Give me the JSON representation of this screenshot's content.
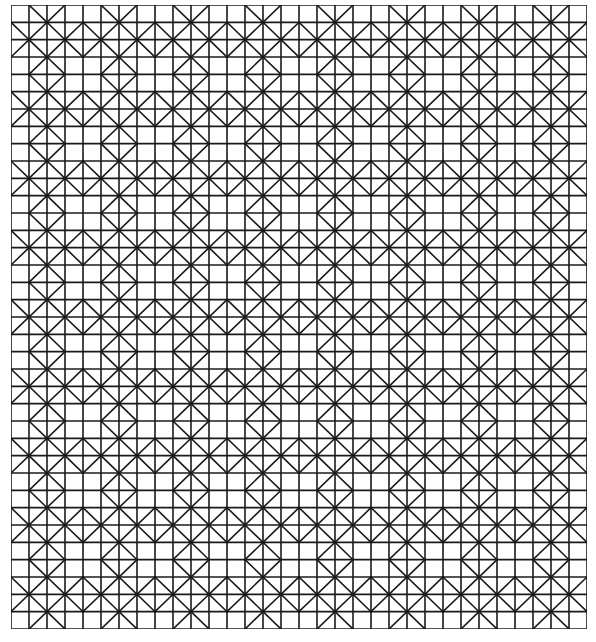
{
  "figure": {
    "type": "geometric-line-pattern",
    "grid": {
      "columns": 32,
      "rows": 36
    },
    "bounds": {
      "x": 11,
      "y": 5,
      "width": 576,
      "height": 624
    },
    "line_color": "#1a1a1a",
    "background_color": "#ffffff",
    "diagonal_pattern_period": {
      "columns": 4,
      "rows": 4
    },
    "diagonal_pattern": [
      [
        "",
        "\\",
        "/",
        ""
      ],
      [
        "\\",
        "/",
        "\\",
        "/"
      ],
      [
        "/",
        "\\",
        "/",
        "\\"
      ],
      [
        "",
        "/",
        "\\",
        ""
      ]
    ]
  }
}
